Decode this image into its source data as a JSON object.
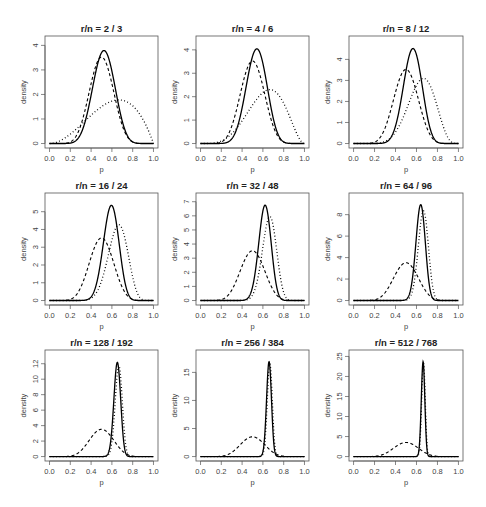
{
  "chart_data": {
    "type": "line",
    "layout": "3x3 grid of density plots",
    "xlabel": "p",
    "ylabel": "density",
    "xlim": [
      0,
      1
    ],
    "x_ticks": [
      "0.0",
      "0.2",
      "0.4",
      "0.6",
      "0.8",
      "1.0"
    ],
    "legend": "none; line styles: dashed = prior, solid = posterior, dotted = likelihood",
    "prior": {
      "alpha": 10,
      "beta": 10
    },
    "panels": [
      {
        "title": "r/n = 2 / 3",
        "r": 2,
        "n": 3,
        "ylim": [
          0,
          4.2
        ],
        "y_ticks": [
          0,
          1,
          2,
          3,
          4
        ],
        "peaks": {
          "solid": 3.8,
          "dashed": 3.5,
          "dotted": 1.8
        }
      },
      {
        "title": "r/n = 4 / 6",
        "r": 4,
        "n": 6,
        "ylim": [
          0,
          4.4
        ],
        "y_ticks": [
          0,
          1,
          2,
          3,
          4
        ],
        "peaks": {
          "solid": 4.0,
          "dashed": 3.5,
          "dotted": 2.3
        }
      },
      {
        "title": "r/n = 8 / 12",
        "r": 8,
        "n": 12,
        "ylim": [
          0,
          4.9
        ],
        "y_ticks": [
          0,
          1,
          2,
          3,
          4
        ],
        "peaks": {
          "solid": 4.5,
          "dashed": 3.5,
          "dotted": 3.1
        }
      },
      {
        "title": "r/n = 16 / 24",
        "r": 16,
        "n": 24,
        "ylim": [
          0,
          5.8
        ],
        "y_ticks": [
          0,
          1,
          2,
          3,
          4,
          5
        ],
        "peaks": {
          "solid": 5.4,
          "dashed": 3.5,
          "dotted": 4.3
        }
      },
      {
        "title": "r/n = 32 / 48",
        "r": 32,
        "n": 48,
        "ylim": [
          0,
          7.3
        ],
        "y_ticks": [
          0,
          1,
          2,
          3,
          4,
          5,
          6,
          7
        ],
        "peaks": {
          "solid": 6.8,
          "dashed": 3.5,
          "dotted": 5.9
        }
      },
      {
        "title": "r/n = 64 / 96",
        "r": 64,
        "n": 96,
        "ylim": [
          0,
          9.6
        ],
        "y_ticks": [
          0,
          2,
          4,
          6,
          8
        ],
        "peaks": {
          "solid": 8.9,
          "dashed": 3.5,
          "dotted": 8.2
        }
      },
      {
        "title": "r/n = 128 / 192",
        "r": 128,
        "n": 192,
        "ylim": [
          0,
          13.2
        ],
        "y_ticks": [
          0,
          2,
          4,
          6,
          8,
          10,
          12
        ],
        "peaks": {
          "solid": 12.2,
          "dashed": 3.5,
          "dotted": 11.7
        }
      },
      {
        "title": "r/n = 256 / 384",
        "r": 256,
        "n": 384,
        "ylim": [
          0,
          18.2
        ],
        "y_ticks": [
          0,
          5,
          10,
          15
        ],
        "peaks": {
          "solid": 16.9,
          "dashed": 3.5,
          "dotted": 16.5
        }
      },
      {
        "title": "r/n = 512 / 768",
        "r": 512,
        "n": 768,
        "ylim": [
          0,
          25.5
        ],
        "y_ticks": [
          0,
          5,
          10,
          15,
          20,
          25
        ],
        "peaks": {
          "solid": 23.6,
          "dashed": 3.5,
          "dotted": 23.4
        }
      }
    ]
  },
  "style": {
    "line_color": "#000000",
    "frame_color": "#555555",
    "text_color": "#444444"
  }
}
